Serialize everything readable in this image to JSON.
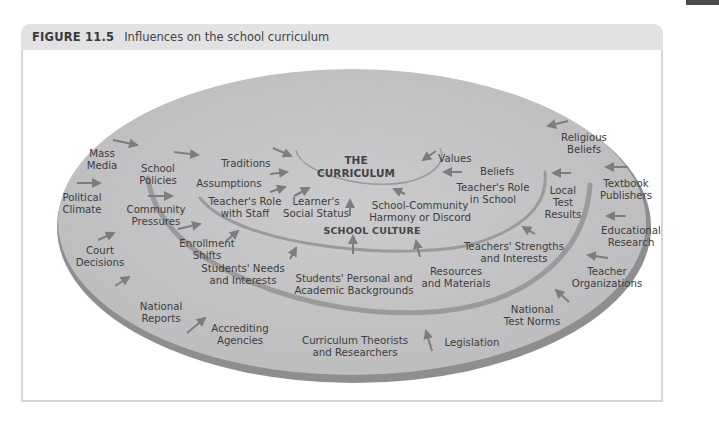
{
  "figure": {
    "number": "FIGURE 11.5",
    "caption": "Influences on the school curriculum"
  },
  "diagram": {
    "core": {
      "label": "THE\nCURRICULUM"
    },
    "school_culture_label": "SCHOOL CULTURE",
    "inner_ring_influences": [
      "Traditions",
      "Assumptions",
      "Teacher's Role\nwith Staff",
      "Learner's\nSocial Status",
      "School-Community\nHarmony or Discord",
      "Values",
      "Beliefs",
      "Teacher's Role\nin School"
    ],
    "middle_ring_influences": [
      "School\nPolicies",
      "Community\nPressures",
      "Enrollment\nShifts",
      "Students' Needs\nand Interests",
      "Students' Personal and\nAcademic Backgrounds",
      "Resources\nand Materials",
      "Teachers' Strengths\nand Interests",
      "Local\nTest\nResults"
    ],
    "outer_ring_influences": [
      "Mass\nMedia",
      "Political\nClimate",
      "Court\nDecisions",
      "National\nReports",
      "Accrediting\nAgencies",
      "Curriculum Theorists\nand Researchers",
      "Legislation",
      "National\nTest Norms",
      "Teacher\nOrganizations",
      "Educational\nResearch",
      "Textbook\nPublishers",
      "Religious\nBeliefs"
    ]
  },
  "colors": {
    "ellipse_fill": "#c2c2c4",
    "ellipse_rim": "#8e8e90",
    "ring_line": "#9a9a9c",
    "arrow": "#7d7d80",
    "text": "#3c3c3c",
    "header_bg": "#e2e2e4",
    "frame_border": "#d6d6d8",
    "corner_tab": "#4a4a4a"
  }
}
